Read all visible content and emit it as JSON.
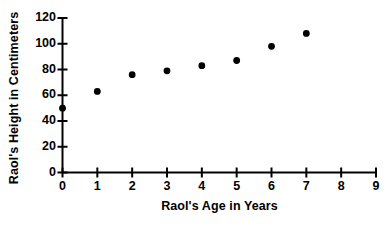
{
  "chart_data": {
    "type": "scatter",
    "title": "",
    "xlabel": "Raol's Age in Years",
    "ylabel": "Raol's Height in Centimeters",
    "x": [
      0,
      1,
      2,
      3,
      4,
      5,
      6,
      7
    ],
    "values": [
      50,
      63,
      76,
      79,
      83,
      87,
      98,
      108
    ],
    "series": [
      {
        "name": "Raol's height",
        "points": [
          {
            "x": 0,
            "y": 50
          },
          {
            "x": 1,
            "y": 63
          },
          {
            "x": 2,
            "y": 76
          },
          {
            "x": 3,
            "y": 79
          },
          {
            "x": 4,
            "y": 83
          },
          {
            "x": 5,
            "y": 87
          },
          {
            "x": 6,
            "y": 98
          },
          {
            "x": 7,
            "y": 108
          }
        ]
      }
    ],
    "xlim": [
      0,
      9
    ],
    "ylim": [
      0,
      120
    ],
    "xticks": [
      0,
      1,
      2,
      3,
      4,
      5,
      6,
      7,
      8,
      9
    ],
    "yticks": [
      0,
      20,
      40,
      60,
      80,
      100,
      120
    ],
    "xtick_labels": [
      "0",
      "1",
      "2",
      "3",
      "4",
      "5",
      "6",
      "7",
      "8",
      "9"
    ],
    "ytick_labels": [
      "0",
      "20",
      "40",
      "60",
      "80",
      "100",
      "120"
    ],
    "grid": false,
    "legend": false,
    "marker": "filled-circle",
    "marker_color": "#000000",
    "axis_color": "#000000",
    "background_color": "#ffffff"
  },
  "axes": {
    "x_title": "Raol's Age in Years",
    "y_title": "Raol's Height in Centimeters"
  }
}
